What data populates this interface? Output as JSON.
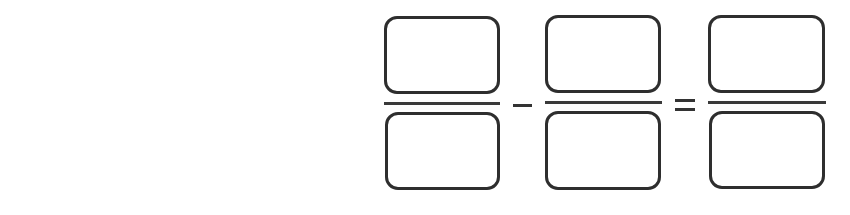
{
  "worksheet": {
    "description": "Fraction subtraction template",
    "operator_1": "minus",
    "operator_2": "equals",
    "fractions": [
      {
        "numerator": "",
        "denominator": ""
      },
      {
        "numerator": "",
        "denominator": ""
      },
      {
        "numerator": "",
        "denominator": ""
      }
    ],
    "colors": {
      "stroke": "#2e2e2e",
      "background": "#ffffff"
    }
  }
}
